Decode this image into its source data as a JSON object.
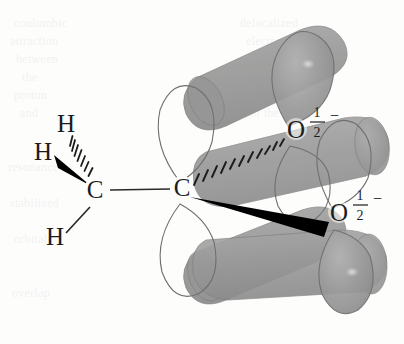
{
  "figure": {
    "background_color": "#fdfdfc",
    "ink_color": "#1c1c1c"
  },
  "palette": {
    "lobe_fill": "#9a9a9a",
    "lobe_fill_dark": "#8a8a8a",
    "lobe_outline": "#6f6f6f",
    "band_fill": "#9d9d9d",
    "band_overlap": "#878787",
    "highlight": "#c9c9c9",
    "bond_color": "#2a2a2a",
    "wedge_color": "#000000"
  },
  "atoms": [
    {
      "id": "c-methyl",
      "label": "C",
      "x": 95,
      "y": 196,
      "name": "methyl-carbon"
    },
    {
      "id": "c-central",
      "label": "C",
      "x": 182,
      "y": 193,
      "name": "carboxyl-carbon"
    },
    {
      "id": "o-upper",
      "label": "O",
      "x": 295,
      "y": 136,
      "name": "oxygen-upper"
    },
    {
      "id": "o-lower",
      "label": "O",
      "x": 338,
      "y": 219,
      "name": "oxygen-lower"
    },
    {
      "id": "h-top",
      "label": "H",
      "x": 66,
      "y": 131,
      "name": "hydrogen-top"
    },
    {
      "id": "h-left",
      "label": "H",
      "x": 43,
      "y": 159,
      "name": "hydrogen-left"
    },
    {
      "id": "h-bottom",
      "label": "H",
      "x": 55,
      "y": 243,
      "name": "hydrogen-bottom"
    }
  ],
  "charges": [
    {
      "id": "charge-upper",
      "numerator": "1",
      "denominator": "2",
      "sign": "−",
      "x": 316,
      "y": 122,
      "name": "partial-charge-upper-oxygen"
    },
    {
      "id": "charge-lower",
      "numerator": "1",
      "denominator": "2",
      "sign": "−",
      "x": 360,
      "y": 205,
      "name": "partial-charge-lower-oxygen"
    }
  ],
  "bonds": [
    {
      "id": "bond-cc",
      "kind": "plain-line",
      "from": "c-methyl",
      "to": "c-central",
      "name": "bond-methyl-to-carboxyl-carbon"
    },
    {
      "id": "bond-c-h-bottom",
      "kind": "plain-line",
      "from": "c-methyl",
      "to": "h-bottom",
      "name": "bond-carbon-to-hydrogen-bottom"
    },
    {
      "id": "bond-c-h-left",
      "kind": "wedge",
      "from": "c-methyl",
      "to": "h-left",
      "name": "bond-carbon-to-hydrogen-left-wedge"
    },
    {
      "id": "bond-c-h-top",
      "kind": "hashed",
      "from": "c-methyl",
      "to": "h-top",
      "hash_count": 7,
      "name": "bond-carbon-to-hydrogen-top-hashed"
    },
    {
      "id": "bond-c-o-upper",
      "kind": "hashed",
      "from": "c-central",
      "to": "o-upper",
      "hash_count": 11,
      "name": "bond-carboxyl-carbon-to-upper-oxygen-hashed"
    },
    {
      "id": "bond-c-o-lower",
      "kind": "wedge",
      "from": "c-central",
      "to": "o-lower",
      "name": "bond-carboxyl-carbon-to-lower-oxygen-wedge"
    }
  ],
  "orbital_lobes": [
    {
      "id": "lobe-c-up",
      "atom": "c-central",
      "side": "up",
      "name": "p-orbital-lobe-carbon-upper"
    },
    {
      "id": "lobe-c-down",
      "atom": "c-central",
      "side": "down",
      "name": "p-orbital-lobe-carbon-lower"
    },
    {
      "id": "lobe-o1-up",
      "atom": "o-upper",
      "side": "up",
      "name": "p-orbital-lobe-upper-oxygen-upper"
    },
    {
      "id": "lobe-o1-down",
      "atom": "o-upper",
      "side": "down",
      "name": "p-orbital-lobe-upper-oxygen-lower"
    },
    {
      "id": "lobe-o2-up",
      "atom": "o-lower",
      "side": "up",
      "name": "p-orbital-lobe-lower-oxygen-upper"
    },
    {
      "id": "lobe-o2-down",
      "atom": "o-lower",
      "side": "down",
      "name": "p-orbital-lobe-lower-oxygen-lower"
    }
  ],
  "overlap_bands": [
    {
      "id": "band-back-up",
      "name": "pi-overlap-band-back-upper"
    },
    {
      "id": "band-back-down",
      "name": "pi-overlap-band-back-lower"
    },
    {
      "id": "band-front-up",
      "name": "pi-overlap-band-front-upper"
    },
    {
      "id": "band-front-down",
      "name": "pi-overlap-band-front-lower"
    }
  ],
  "ghost_text": [
    {
      "text": "coulombic",
      "x": 14,
      "y": 16
    },
    {
      "text": "attraction",
      "x": 10,
      "y": 34
    },
    {
      "text": "between",
      "x": 16,
      "y": 52
    },
    {
      "text": "the",
      "x": 22,
      "y": 70
    },
    {
      "text": "proton",
      "x": 14,
      "y": 88
    },
    {
      "text": "and",
      "x": 20,
      "y": 106
    },
    {
      "text": "resonance",
      "x": 8,
      "y": 160
    },
    {
      "text": "stabilized",
      "x": 10,
      "y": 196
    },
    {
      "text": "orbitals",
      "x": 14,
      "y": 232
    },
    {
      "text": "overlap",
      "x": 12,
      "y": 286
    },
    {
      "text": "delocalized",
      "x": 240,
      "y": 16
    },
    {
      "text": "electrons",
      "x": 246,
      "y": 34
    },
    {
      "text": "over the",
      "x": 250,
      "y": 52
    },
    {
      "text": "carboxyl",
      "x": 244,
      "y": 70
    },
    {
      "text": "group",
      "x": 252,
      "y": 88
    },
    {
      "text": "of the",
      "x": 250,
      "y": 106
    }
  ]
}
